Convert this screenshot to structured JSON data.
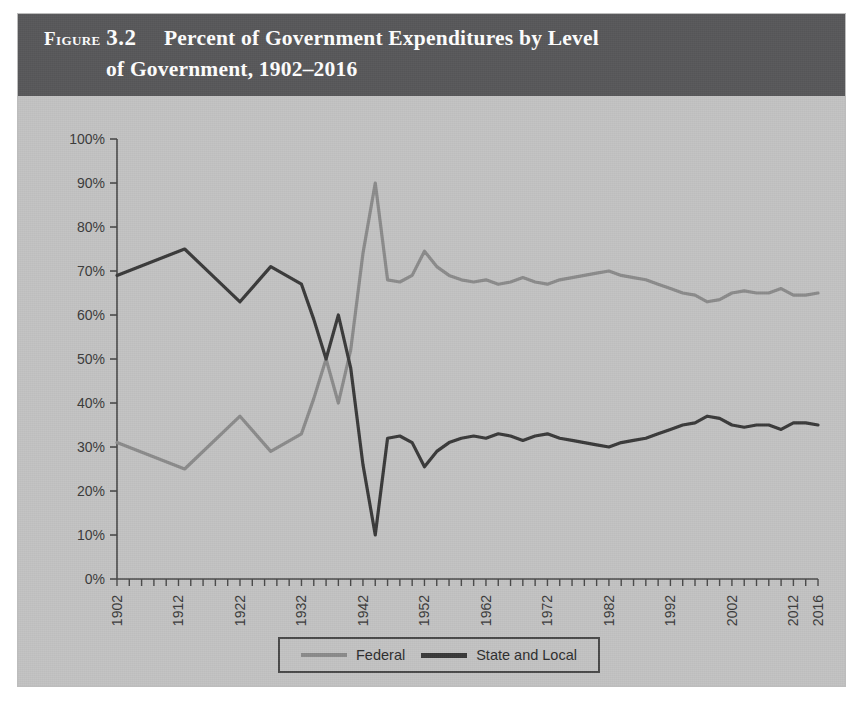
{
  "figure": {
    "label": "Figure",
    "number": "3.2",
    "title_line_1": "Percent of Government Expenditures by Level",
    "title_line_2": "of Government, 1902–2016"
  },
  "legend": {
    "position": "bottom-center",
    "entries": [
      {
        "name": "federal",
        "label": "Federal",
        "color": "#8b8b8b"
      },
      {
        "name": "state-and-local",
        "label": "State and Local",
        "color": "#3a3a3a"
      }
    ]
  },
  "axes": {
    "y_tick_labels": [
      "100%",
      "90%",
      "80%",
      "70%",
      "60%",
      "50%",
      "40%",
      "30%",
      "20%",
      "10%",
      "0%"
    ],
    "x_tick_labels": [
      "1902",
      "1912",
      "1922",
      "1932",
      "1942",
      "1952",
      "1962",
      "1972",
      "1982",
      "1992",
      "2002",
      "2012",
      "2016"
    ],
    "ylim": [
      0,
      100
    ],
    "xlim": [
      1902,
      2016
    ],
    "grid": false
  },
  "colors": {
    "banner": "#58585a",
    "page": "#c3c3c3",
    "federal_line": "#8b8b8b",
    "state_local_line": "#3a3a3a",
    "axis": "#4a4a4a"
  },
  "chart_data": {
    "type": "line",
    "title": "Percent of Government Expenditures by Level of Government, 1902–2016",
    "xlabel": "",
    "ylabel": "",
    "ylim": [
      0,
      100
    ],
    "xlim": [
      1902,
      2016
    ],
    "grid": false,
    "legend_position": "bottom-center",
    "unit": "percent",
    "x": [
      1902,
      1913,
      1922,
      1927,
      1932,
      1934,
      1936,
      1938,
      1940,
      1942,
      1944,
      1946,
      1948,
      1950,
      1952,
      1954,
      1956,
      1958,
      1960,
      1962,
      1964,
      1966,
      1968,
      1970,
      1972,
      1974,
      1976,
      1978,
      1980,
      1982,
      1984,
      1986,
      1988,
      1990,
      1992,
      1994,
      1996,
      1998,
      2000,
      2002,
      2004,
      2006,
      2008,
      2010,
      2012,
      2014,
      2016
    ],
    "series": [
      {
        "name": "Federal",
        "color": "#8b8b8b",
        "values": [
          31,
          25,
          37,
          29,
          33,
          41,
          50,
          40,
          52,
          74,
          90,
          68,
          67.5,
          69,
          74.5,
          71,
          69,
          68,
          67.5,
          68,
          67,
          67.5,
          68.5,
          67.5,
          67,
          68,
          68.5,
          69,
          69.5,
          70,
          69,
          68.5,
          68,
          67,
          66,
          65,
          64.5,
          63,
          63.5,
          65,
          65.5,
          65,
          65,
          66,
          64.5,
          64.5,
          65
        ]
      },
      {
        "name": "State and Local",
        "color": "#3a3a3a",
        "values": [
          69,
          75,
          63,
          71,
          67,
          59,
          50,
          60,
          48,
          26,
          10,
          32,
          32.5,
          31,
          25.5,
          29,
          31,
          32,
          32.5,
          32,
          33,
          32.5,
          31.5,
          32.5,
          33,
          32,
          31.5,
          31,
          30.5,
          30,
          31,
          31.5,
          32,
          33,
          34,
          35,
          35.5,
          37,
          36.5,
          35,
          34.5,
          35,
          35,
          34,
          35.5,
          35.5,
          35
        ]
      }
    ]
  }
}
